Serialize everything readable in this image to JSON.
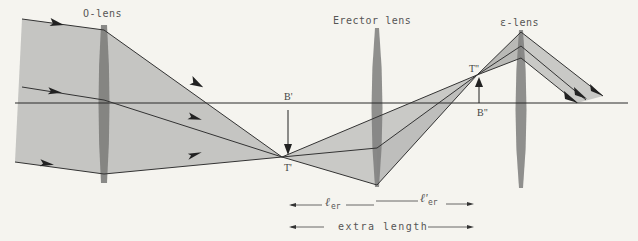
{
  "labels": {
    "o_lens": "O-lens",
    "erector_lens": "Erector lens",
    "e_lens": "ε-lens",
    "b_prime": "B'",
    "t_prime": "T'",
    "t_double_prime": "T\"",
    "b_double_prime": "B\"",
    "l_er": "ℓ",
    "l_er_sub": "er",
    "l_er_prime": "ℓ'",
    "l_er_prime_sub": "er",
    "extra_length": "extra length"
  },
  "colors": {
    "background": "#f5f4ef",
    "beam_fill": "#c2c2bf",
    "beam_fill_dark": "#a9a9a6",
    "lens_fill": "#7d7d7b",
    "ray_stroke": "#333333",
    "axis_stroke": "#2b2b2b"
  },
  "geometry": {
    "optical_axis_y": 103,
    "o_lens_x": 104,
    "erector_lens_x": 377,
    "e_lens_x": 521,
    "intermediate_image_T_prime": [
      282,
      157
    ],
    "intermediate_image_B_prime": [
      282,
      103
    ],
    "final_image_T_double_prime": [
      477,
      75
    ],
    "final_image_B_double_prime": [
      477,
      103
    ]
  }
}
